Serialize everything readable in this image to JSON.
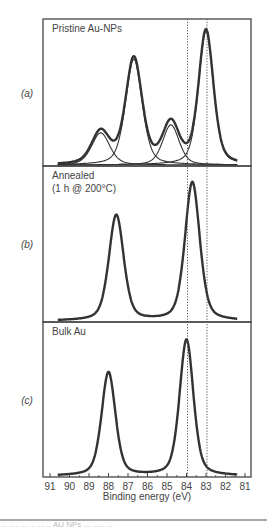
{
  "chart_data": {
    "type": "line",
    "title": "",
    "xlabel": "Binding energy (eV)",
    "ylabel": "",
    "xlim": [
      91,
      81
    ],
    "x_reversed": true,
    "xticks": [
      91,
      90,
      89,
      88,
      87,
      86,
      85,
      84,
      83,
      82,
      81
    ],
    "reference_lines": [
      {
        "x": 84.0,
        "style": "dotted"
      },
      {
        "x": 83.0,
        "style": "dotted"
      }
    ],
    "panels": [
      {
        "id": "a",
        "label": "(a)",
        "title_lines": [
          "Pristine Au-NPs"
        ],
        "components": [
          {
            "name": "component-1",
            "center": 88.4,
            "height": 0.24,
            "width": 0.55
          },
          {
            "name": "component-2",
            "center": 86.7,
            "height": 0.79,
            "width": 0.5
          },
          {
            "name": "component-3",
            "center": 84.8,
            "height": 0.3,
            "width": 0.5
          },
          {
            "name": "component-4",
            "center": 83.0,
            "height": 1.0,
            "width": 0.45
          }
        ],
        "show_components": true,
        "show_envelope": true
      },
      {
        "id": "b",
        "label": "(b)",
        "title_lines": [
          "Annealed",
          "(1 h @ 200°C)"
        ],
        "components": [
          {
            "name": "peak-1",
            "center": 87.6,
            "height": 0.74,
            "width": 0.45
          },
          {
            "name": "peak-2",
            "center": 83.7,
            "height": 0.97,
            "width": 0.45
          }
        ],
        "show_components": false,
        "show_envelope": true
      },
      {
        "id": "c",
        "label": "(c)",
        "title_lines": [
          "Bulk Au"
        ],
        "components": [
          {
            "name": "peak-1",
            "center": 88.0,
            "height": 0.73,
            "width": 0.42
          },
          {
            "name": "peak-2",
            "center": 84.0,
            "height": 0.96,
            "width": 0.42
          }
        ],
        "show_components": false,
        "show_envelope": true
      }
    ]
  },
  "colors": {
    "curve": "#333333",
    "frame": "#444444",
    "dotted": "#555555",
    "text": "#444444"
  },
  "caption_fragment": "... ..... ... .. ... .. AU NPs ... ..... ..."
}
